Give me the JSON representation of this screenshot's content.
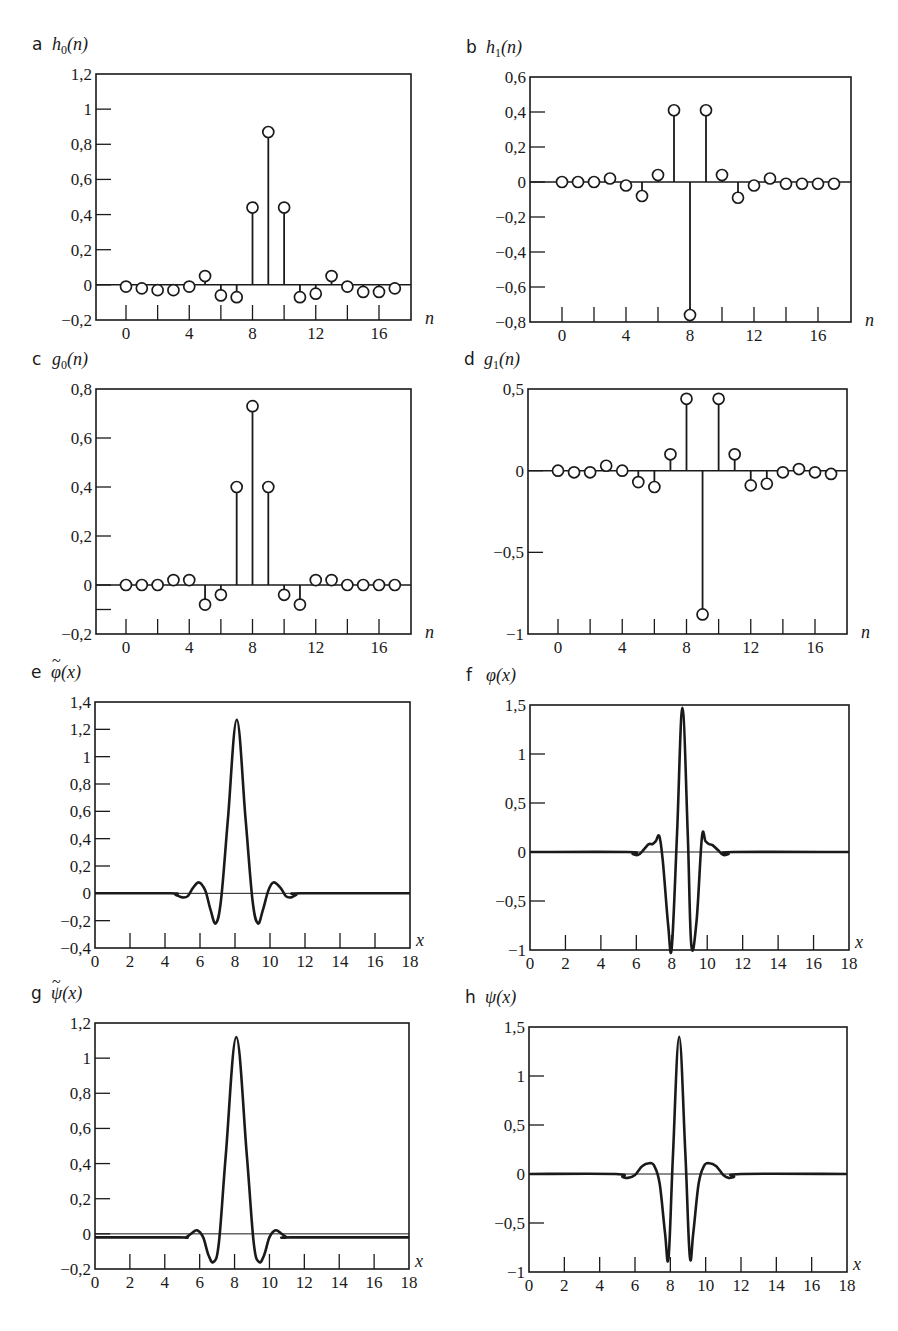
{
  "figure": {
    "panels": [
      "a",
      "b",
      "c",
      "d",
      "e",
      "f",
      "g",
      "h"
    ]
  },
  "chart_data": [
    {
      "id": "a",
      "panel_letter": "a",
      "type": "stem",
      "title": "",
      "ylabel": "h0(n)",
      "ylabel_base": "h",
      "ylabel_sub": "0",
      "ylabel_arg": "(n)",
      "xlabel": "n",
      "xlim": [
        -2,
        18
      ],
      "ylim": [
        -0.2,
        1.2
      ],
      "xticks": [
        0,
        4,
        8,
        12,
        16
      ],
      "xtick_labels": [
        "0",
        "4",
        "8",
        "12",
        "16"
      ],
      "yticks": [
        -0.2,
        0,
        0.2,
        0.4,
        0.6,
        0.8,
        1,
        1.2
      ],
      "ytick_labels": [
        "−0,2",
        "0",
        "0,2",
        "0,4",
        "0,6",
        "0,8",
        "1",
        "1,2"
      ],
      "minor_xticks": [
        0,
        2,
        4,
        6,
        8,
        10,
        12,
        14,
        16
      ],
      "x": [
        0,
        1,
        2,
        3,
        4,
        5,
        6,
        7,
        8,
        9,
        10,
        11,
        12,
        13,
        14,
        15,
        16,
        17
      ],
      "values": [
        -0.01,
        -0.02,
        -0.03,
        -0.03,
        -0.01,
        0.05,
        -0.06,
        -0.07,
        0.44,
        0.87,
        0.44,
        -0.07,
        -0.05,
        0.05,
        -0.01,
        -0.04,
        -0.04,
        -0.02
      ],
      "box": {
        "x0": 96,
        "y0": 74,
        "x1": 411,
        "y1": 320
      },
      "x_to_px": {
        "x0val": 0,
        "x0px": 126,
        "x1val": 16,
        "x1px": 379
      }
    },
    {
      "id": "b",
      "panel_letter": "b",
      "type": "stem",
      "title": "",
      "ylabel": "h1(n)",
      "ylabel_base": "h",
      "ylabel_sub": "1",
      "ylabel_arg": "(n)",
      "xlabel": "n",
      "xlim": [
        -2,
        18
      ],
      "ylim": [
        -0.8,
        0.6
      ],
      "xticks": [
        0,
        4,
        8,
        12,
        16
      ],
      "xtick_labels": [
        "0",
        "4",
        "8",
        "12",
        "16"
      ],
      "yticks": [
        -0.8,
        -0.6,
        -0.4,
        -0.2,
        0,
        0.2,
        0.4,
        0.6
      ],
      "ytick_labels": [
        "−0,8",
        "−0,6",
        "−0,4",
        "−0,2",
        "0",
        "0,2",
        "0,4",
        "0,6"
      ],
      "minor_xticks": [
        0,
        2,
        4,
        6,
        8,
        10,
        12,
        14,
        16
      ],
      "x": [
        0,
        1,
        2,
        3,
        4,
        5,
        6,
        7,
        8,
        9,
        10,
        11,
        12,
        13,
        14,
        15,
        16,
        17
      ],
      "values": [
        0,
        0,
        0,
        0.02,
        -0.02,
        -0.08,
        0.04,
        0.41,
        -0.76,
        0.41,
        0.04,
        -0.09,
        -0.02,
        0.02,
        -0.01,
        -0.01,
        -0.01,
        -0.01
      ],
      "box": {
        "x0": 530,
        "y0": 77,
        "x1": 851,
        "y1": 322
      },
      "x_to_px": {
        "x0val": 0,
        "x0px": 562,
        "x1val": 16,
        "x1px": 818
      }
    },
    {
      "id": "c",
      "panel_letter": "c",
      "type": "stem",
      "title": "",
      "ylabel": "g0(n)",
      "ylabel_base": "g",
      "ylabel_sub": "0",
      "ylabel_arg": "(n)",
      "xlabel": "n",
      "xlim": [
        -2,
        18
      ],
      "ylim": [
        -0.2,
        0.8
      ],
      "xticks": [
        0,
        4,
        8,
        12,
        16
      ],
      "xtick_labels": [
        "0",
        "4",
        "8",
        "12",
        "16"
      ],
      "yticks": [
        -0.2,
        -0.1,
        0,
        0.2,
        0.4,
        0.6,
        0.8
      ],
      "ytick_labels": [
        "−0,2",
        "",
        "0",
        "0,2",
        "0,4",
        "0,6",
        "0,8"
      ],
      "minor_xticks": [
        0,
        2,
        4,
        6,
        8,
        10,
        12,
        14,
        16
      ],
      "x": [
        0,
        1,
        2,
        3,
        4,
        5,
        6,
        7,
        8,
        9,
        10,
        11,
        12,
        13,
        14,
        15,
        16,
        17
      ],
      "values": [
        0,
        0,
        0,
        0.02,
        0.02,
        -0.08,
        -0.04,
        0.4,
        0.73,
        0.4,
        -0.04,
        -0.08,
        0.02,
        0.02,
        0,
        0,
        0,
        0
      ],
      "box": {
        "x0": 96,
        "y0": 389,
        "x1": 411,
        "y1": 634
      },
      "x_to_px": {
        "x0val": 0,
        "x0px": 126,
        "x1val": 16,
        "x1px": 379
      }
    },
    {
      "id": "d",
      "panel_letter": "d",
      "type": "stem",
      "title": "",
      "ylabel": "g1(n)",
      "ylabel_base": "g",
      "ylabel_sub": "1",
      "ylabel_arg": "(n)",
      "xlabel": "n",
      "xlim": [
        -2,
        18
      ],
      "ylim": [
        -1,
        0.5
      ],
      "xticks": [
        0,
        4,
        8,
        12,
        16
      ],
      "xtick_labels": [
        "0",
        "4",
        "8",
        "12",
        "16"
      ],
      "yticks": [
        -1,
        -0.5,
        0,
        0.5
      ],
      "ytick_labels": [
        "−1",
        "−0,5",
        "0",
        "0,5"
      ],
      "minor_xticks": [
        0,
        2,
        4,
        6,
        8,
        10,
        12,
        14,
        16
      ],
      "x": [
        0,
        1,
        2,
        3,
        4,
        5,
        6,
        7,
        8,
        9,
        10,
        11,
        12,
        13,
        14,
        15,
        16,
        17
      ],
      "values": [
        0,
        -0.01,
        -0.01,
        0.03,
        0,
        -0.07,
        -0.1,
        0.1,
        0.44,
        -0.88,
        0.44,
        0.1,
        -0.09,
        -0.08,
        -0.01,
        0.01,
        -0.01,
        -0.02
      ],
      "box": {
        "x0": 528,
        "y0": 389,
        "x1": 847,
        "y1": 634
      },
      "x_to_px": {
        "x0val": 0,
        "x0px": 558,
        "x1val": 16,
        "x1px": 815
      }
    },
    {
      "id": "e",
      "panel_letter": "e",
      "type": "line",
      "title": "",
      "ylabel": "φ̃(x)",
      "ylabel_base": "φ",
      "ylabel_tilde": true,
      "ylabel_arg": "(x)",
      "xlabel": "x",
      "xlim": [
        0,
        18
      ],
      "ylim": [
        -0.4,
        1.4
      ],
      "xticks": [
        0,
        2,
        4,
        6,
        8,
        10,
        12,
        14,
        16,
        18
      ],
      "xtick_labels": [
        "0",
        "2",
        "4",
        "6",
        "8",
        "10",
        "12",
        "14",
        "16",
        "18"
      ],
      "yticks": [
        -0.4,
        -0.2,
        0,
        0.2,
        0.4,
        0.6,
        0.8,
        1,
        1.2,
        1.4
      ],
      "ytick_labels": [
        "−0,4",
        "−0,2",
        "0",
        "0,2",
        "0,4",
        "0,6",
        "0,8",
        "1",
        "1,2",
        "1,4"
      ],
      "x": [
        0,
        4.3,
        4.6,
        5.0,
        5.3,
        5.6,
        5.95,
        6.3,
        6.6,
        6.9,
        7.2,
        7.6,
        8.1,
        8.6,
        9.0,
        9.3,
        9.6,
        9.9,
        10.2,
        10.6,
        10.9,
        11.2,
        11.5,
        11.8,
        18
      ],
      "values": [
        0,
        0,
        -0.01,
        -0.03,
        -0.02,
        0.04,
        0.08,
        0.02,
        -0.12,
        -0.22,
        -0.05,
        0.55,
        1.27,
        0.55,
        -0.05,
        -0.22,
        -0.12,
        0.02,
        0.08,
        0.04,
        -0.02,
        -0.03,
        -0.01,
        0,
        0
      ],
      "box": {
        "x0": 95,
        "y0": 702,
        "x1": 410,
        "y1": 948
      }
    },
    {
      "id": "f",
      "panel_letter": "f",
      "type": "line",
      "title": "",
      "ylabel": "φ(x)",
      "ylabel_base": "φ",
      "ylabel_arg": "(x)",
      "xlabel": "x",
      "xlim": [
        0,
        18
      ],
      "ylim": [
        -1,
        1.5
      ],
      "xticks": [
        0,
        2,
        4,
        6,
        8,
        10,
        12,
        14,
        16,
        18
      ],
      "xtick_labels": [
        "0",
        "2",
        "4",
        "6",
        "8",
        "10",
        "12",
        "14",
        "16",
        "18"
      ],
      "yticks": [
        -1,
        -0.5,
        0,
        0.5,
        1,
        1.5
      ],
      "ytick_labels": [
        "−1",
        "−0,5",
        "0",
        "0,5",
        "1",
        "1,5"
      ],
      "x": [
        0,
        5.5,
        5.8,
        6.1,
        6.4,
        6.7,
        6.9,
        7.1,
        7.3,
        7.5,
        7.8,
        8.0,
        8.3,
        8.6,
        8.9,
        9.1,
        9.4,
        9.7,
        9.9,
        10.1,
        10.3,
        10.6,
        10.9,
        11.2,
        11.5,
        18
      ],
      "values": [
        0,
        0,
        -0.02,
        -0.03,
        0.02,
        0.08,
        0.08,
        0.11,
        0.16,
        -0.1,
        -0.75,
        -0.97,
        0.2,
        1.47,
        0.2,
        -0.95,
        -0.7,
        0.15,
        0.11,
        0.08,
        0.07,
        0.02,
        -0.03,
        -0.02,
        0,
        0
      ],
      "box": {
        "x0": 530,
        "y0": 705,
        "x1": 849,
        "y1": 950
      }
    },
    {
      "id": "g",
      "panel_letter": "g",
      "type": "line",
      "title": "",
      "ylabel": "ψ̃(x)",
      "ylabel_base": "ψ",
      "ylabel_tilde": true,
      "ylabel_arg": "(x)",
      "xlabel": "x",
      "xlim": [
        0,
        18
      ],
      "ylim": [
        -0.2,
        1.2
      ],
      "xticks": [
        0,
        2,
        4,
        6,
        8,
        10,
        12,
        14,
        16,
        18
      ],
      "xtick_labels": [
        "0",
        "2",
        "4",
        "6",
        "8",
        "10",
        "12",
        "14",
        "16",
        "18"
      ],
      "yticks": [
        -0.2,
        0,
        0.2,
        0.4,
        0.6,
        0.8,
        1,
        1.2
      ],
      "ytick_labels": [
        "−0,2",
        "0",
        "0,2",
        "0,4",
        "0,6",
        "0,8",
        "1",
        "1,2"
      ],
      "x": [
        0,
        4.8,
        5.2,
        5.5,
        5.85,
        6.2,
        6.5,
        6.8,
        7.1,
        7.5,
        8.1,
        8.7,
        9.1,
        9.4,
        9.7,
        10.0,
        10.35,
        10.7,
        11.0,
        11.3,
        18
      ],
      "values": [
        -0.02,
        -0.02,
        -0.02,
        0,
        0.02,
        -0.02,
        -0.12,
        -0.16,
        -0.05,
        0.45,
        1.12,
        0.45,
        -0.05,
        -0.16,
        -0.12,
        -0.02,
        0.02,
        0,
        -0.02,
        -0.02,
        -0.02
      ],
      "box": {
        "x0": 95,
        "y0": 1023,
        "x1": 409,
        "y1": 1269
      }
    },
    {
      "id": "h",
      "panel_letter": "h",
      "type": "line",
      "title": "",
      "ylabel": "ψ(x)",
      "ylabel_base": "ψ",
      "ylabel_arg": "(x)",
      "xlabel": "x",
      "xlim": [
        0,
        18
      ],
      "ylim": [
        -1,
        1.5
      ],
      "xticks": [
        0,
        2,
        4,
        6,
        8,
        10,
        12,
        14,
        16,
        18
      ],
      "xtick_labels": [
        "0",
        "2",
        "4",
        "6",
        "8",
        "10",
        "12",
        "14",
        "16",
        "18"
      ],
      "yticks": [
        -1,
        -0.5,
        0,
        0.5,
        1,
        1.5
      ],
      "ytick_labels": [
        "−1",
        "−0,5",
        "0",
        "0,5",
        "1",
        "1,5"
      ],
      "x": [
        0,
        4.9,
        5.3,
        5.6,
        6.0,
        6.4,
        6.8,
        7.1,
        7.4,
        7.7,
        7.9,
        8.15,
        8.5,
        8.85,
        9.1,
        9.3,
        9.6,
        9.9,
        10.2,
        10.6,
        11.0,
        11.3,
        11.6,
        12.0,
        18
      ],
      "values": [
        0,
        0,
        -0.03,
        -0.04,
        -0.01,
        0.08,
        0.11,
        0.08,
        -0.1,
        -0.6,
        -0.85,
        0.2,
        1.4,
        0.2,
        -0.84,
        -0.6,
        -0.1,
        0.08,
        0.11,
        0.08,
        -0.01,
        -0.04,
        -0.03,
        0,
        0
      ],
      "box": {
        "x0": 529,
        "y0": 1027,
        "x1": 847,
        "y1": 1272
      }
    }
  ]
}
